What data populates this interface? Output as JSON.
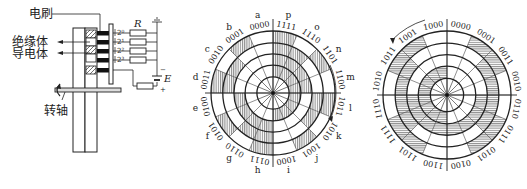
{
  "figure": {
    "panels": [
      {
        "id": "encoder-assembly",
        "labels": {
          "brush": "电刷",
          "insulator": "绝缘体",
          "conductor": "导电体",
          "shaft": "转轴",
          "resistor": "R",
          "source": "E",
          "minus": "−",
          "plus": "+"
        },
        "bit_weights": [
          "2⁰",
          "2¹",
          "2²",
          "2³"
        ]
      },
      {
        "id": "binary-code-disc",
        "hatch": "vertical",
        "sector_letters": [
          "a",
          "b",
          "c",
          "d",
          "e",
          "f",
          "g",
          "h",
          "i",
          "j",
          "k",
          "l",
          "m",
          "n",
          "o",
          "p"
        ],
        "codes": [
          "0000",
          "0001",
          "0010",
          "0011",
          "0100",
          "0101",
          "0110",
          "0111",
          "1000",
          "1001",
          "1010",
          "1011",
          "1100",
          "1101",
          "1110",
          "1111"
        ]
      },
      {
        "id": "gray-code-disc",
        "hatch": "horizontal",
        "codes": [
          "0000",
          "0001",
          "0011",
          "0010",
          "0110",
          "0111",
          "0101",
          "0100",
          "1100",
          "1101",
          "1111",
          "1110",
          "1010",
          "1011",
          "1001",
          "1000"
        ]
      }
    ],
    "colors": {
      "ink": "#222222",
      "background": "#ffffff"
    }
  }
}
